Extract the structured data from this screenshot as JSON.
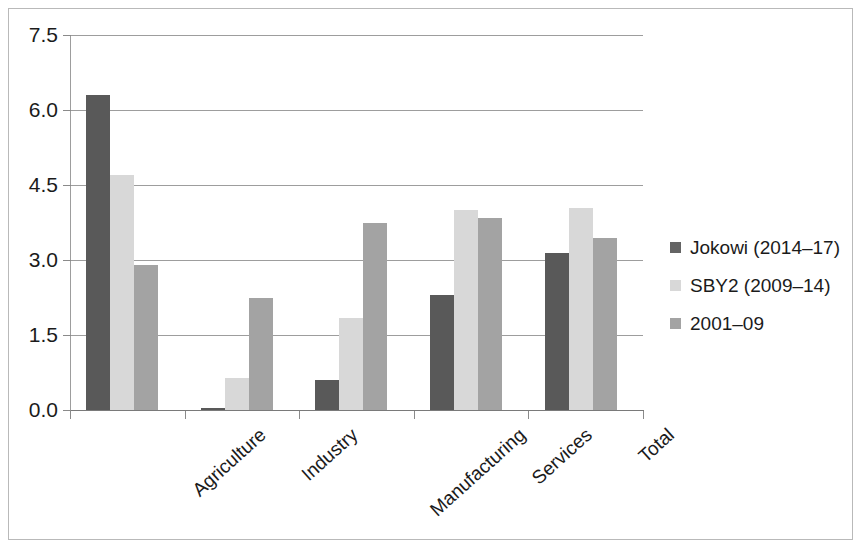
{
  "chart_data": {
    "type": "bar",
    "title": "",
    "xlabel": "",
    "ylabel": "",
    "ylim": [
      0.0,
      7.5
    ],
    "yticks": [
      "0.0",
      "1.5",
      "3.0",
      "4.5",
      "6.0",
      "7.5"
    ],
    "grid": true,
    "legend_position": "right",
    "categories": [
      "Agriculture",
      "Industry",
      "Manufacturing",
      "Services",
      "Total"
    ],
    "series": [
      {
        "name": "Jokowi (2014–17)",
        "color": "#595959",
        "values": [
          6.3,
          0.05,
          0.6,
          2.3,
          3.15
        ]
      },
      {
        "name": "SBY2 (2009–14)",
        "color": "#d8d8d8",
        "values": [
          4.7,
          0.65,
          1.85,
          4.0,
          4.05
        ]
      },
      {
        "name": "2001–09",
        "color": "#a3a3a3",
        "values": [
          2.9,
          2.25,
          3.75,
          3.85,
          3.45
        ]
      }
    ]
  },
  "legend": {
    "items": [
      {
        "label": "Jokowi (2014–17)"
      },
      {
        "label": "SBY2 (2009–14)"
      },
      {
        "label": "2001–09"
      }
    ]
  }
}
